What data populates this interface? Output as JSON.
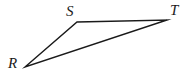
{
  "figure": {
    "name": "triangle-rst",
    "background_color": "#ffffff",
    "width": 188,
    "height": 82,
    "stroke_color": "#1a1a1a",
    "stroke_width": 1.4
  },
  "labels": {
    "r": "R",
    "s": "S",
    "t": "T"
  },
  "chart_data": {
    "type": "diagram",
    "shape": "triangle",
    "title": "",
    "vertices": [
      {
        "label": "R",
        "x": 25,
        "y": 67
      },
      {
        "label": "S",
        "x": 77,
        "y": 22
      },
      {
        "label": "T",
        "x": 167,
        "y": 20
      }
    ],
    "edges": [
      {
        "from": "R",
        "to": "S"
      },
      {
        "from": "S",
        "to": "T"
      },
      {
        "from": "R",
        "to": "T"
      }
    ],
    "label_positions": [
      {
        "label": "R",
        "x": 8,
        "y": 56
      },
      {
        "label": "S",
        "x": 66,
        "y": 4
      },
      {
        "label": "T",
        "x": 170,
        "y": 3
      }
    ]
  }
}
